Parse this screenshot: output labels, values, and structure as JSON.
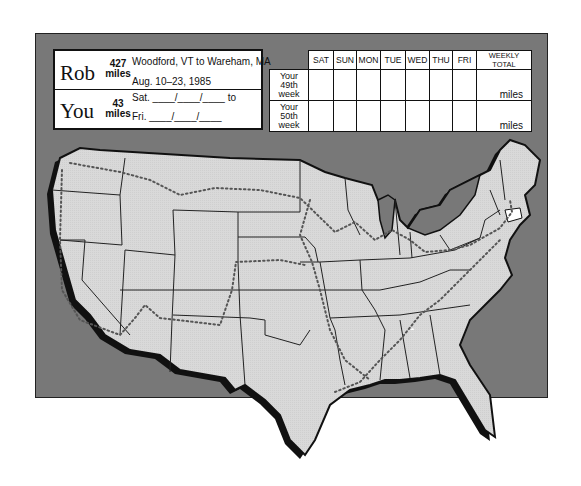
{
  "colors": {
    "frame_bg": "#787878",
    "map_fill": "#d9d9d9",
    "coast_shadow": "#111111",
    "highlight_state": "#ffffff"
  },
  "rob": {
    "name": "Rob",
    "miles_value": "427",
    "miles_unit": "miles",
    "route": "Woodford, VT to Wareham, MA",
    "dates": "Aug. 10–23, 1985"
  },
  "you": {
    "name": "You",
    "miles_value": "43",
    "miles_unit": "miles",
    "start_line": "Sat. ____/____/____ to",
    "end_line": "Fri. ____/____/____"
  },
  "week_table": {
    "columns": [
      "SAT",
      "SUN",
      "MON",
      "TUE",
      "WED",
      "THU",
      "FRI",
      "WEEKLY TOTAL"
    ],
    "rows": [
      {
        "label_1": "Your",
        "label_2": "49th",
        "label_3": "week",
        "total_unit": "miles"
      },
      {
        "label_1": "Your",
        "label_2": "50th",
        "label_3": "week",
        "total_unit": "miles"
      }
    ]
  },
  "map": {
    "subject": "United States map with dotted route",
    "highlighted_state": "Connecticut"
  }
}
